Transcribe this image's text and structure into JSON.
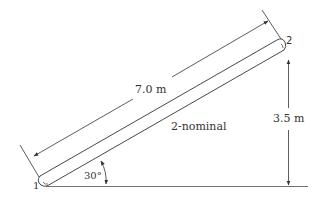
{
  "diagram": {
    "pipe_label": "2-nominal",
    "length_label": "7.0 m",
    "height_label": "3.5 m",
    "angle_label": "30°",
    "point_1_label": "1",
    "point_2_label": "2"
  },
  "colors": {
    "line": "#333333",
    "ground": "#6a7a6a",
    "text": "#333333",
    "background": "#ffffff"
  }
}
